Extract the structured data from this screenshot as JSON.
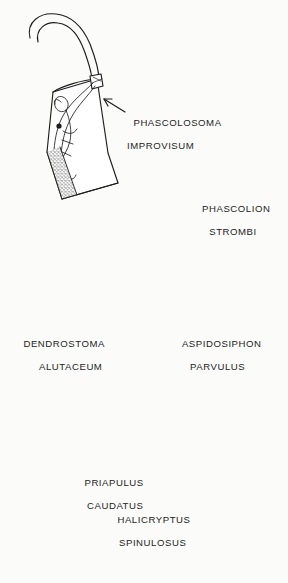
{
  "plate": {
    "header_fragment": "PLATE 21",
    "background_color": "#fbfbfa",
    "ink_color": "#1d1d1d",
    "medium": "pen-and-ink engraving",
    "subject": "marine worms: sipunculans and priapulids"
  },
  "specimens": [
    {
      "id": "phascolosoma-improvisum",
      "genus": "PHASCOLOSOMA",
      "species": "IMPROVISUM",
      "label_line1": "PHASCOLOSOMA",
      "label_line2": "IMPROVISUM",
      "has_leader_arrow": true,
      "arrow_direction": "up-left",
      "position": "top-left",
      "description": "tubular trunk drawn semi-transparent showing internal retractor muscles and gut, long sinuous introvert, stippled posterior end"
    },
    {
      "id": "phascolion-strombi",
      "genus": "PHASCOLION",
      "species": "STROMBI",
      "label_line1": "PHASCOLION",
      "label_line2": "STROMBI",
      "has_leader_arrow": false,
      "arrow_direction": "",
      "position": "top-right",
      "description": "long slender looped introvert with dark tentacular tip leading to a stippled shell-shaped body with radiating striations"
    },
    {
      "id": "dendrostoma-alutaceum",
      "genus": "DENDROSTOMA",
      "species": "ALUTACEUM",
      "label_line1": "DENDROSTOMA",
      "label_line2": "ALUTACEUM",
      "has_leader_arrow": false,
      "arrow_direction": "",
      "position": "middle-left",
      "description": "stippled hook-shaped J body with a branched tentacle crown at the anterior end"
    },
    {
      "id": "aspidosiphon-parvulus",
      "genus": "ASPIDOSIPHON",
      "species": "PARVULUS",
      "label_line1": "ASPIDOSIPHON",
      "label_line2": "PARVULUS",
      "has_leader_arrow": false,
      "arrow_direction": "",
      "position": "middle-right",
      "description": "curved comma-shaped body with dense transverse banding and a pale smooth introvert"
    },
    {
      "id": "priapulus-caudatus",
      "genus": "PRIAPULUS",
      "species": "CAUDATUS",
      "label_line1": "PRIAPULUS",
      "label_line2": "CAUDATUS",
      "has_leader_arrow": true,
      "arrow_direction": "up-left",
      "position": "bottom-left",
      "description": "bulbous reticulated proboscis, curved annulated trunk, terminating in a bushy caudal appendage"
    },
    {
      "id": "halicryptus-spinulosus",
      "genus": "HALICRYPTUS",
      "species": "SPINULOSUS",
      "label_line1": "HALICRYPTUS",
      "label_line2": "SPINULOSUS",
      "has_leader_arrow": true,
      "arrow_direction": "up-right",
      "position": "bottom-right",
      "description": "dark heavily cross-hatched ovoid body with a crown of spines at the anterior end"
    }
  ]
}
